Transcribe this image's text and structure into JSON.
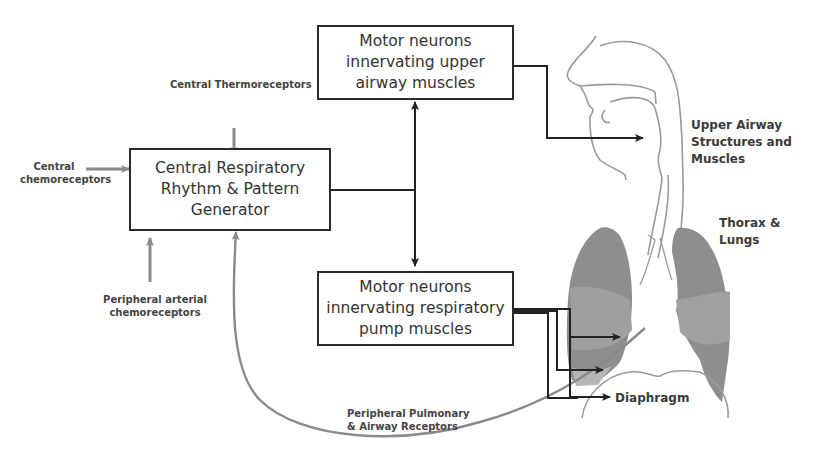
{
  "diagram": {
    "boxes": {
      "cprg": [
        "Central Respiratory",
        "Rhythm & Pattern",
        "Generator"
      ],
      "upper": [
        "Motor neurons",
        "innervating upper",
        "airway muscles"
      ],
      "pump": [
        "Motor neurons",
        "innervating respiratory",
        "pump muscles"
      ]
    },
    "inputs": {
      "thermo": "Central Thermoreceptors",
      "chemo_central": [
        "Central",
        "chemoreceptors"
      ],
      "chemo_peripheral": [
        "Peripheral arterial",
        "chemoreceptors"
      ],
      "pulmonary": [
        "Peripheral Pulmonary",
        "& Airway Receptors"
      ]
    },
    "targets": {
      "upper_airway": [
        "Upper Airway",
        "Structures and Muscles"
      ],
      "thorax": [
        "Thorax &",
        "Lungs"
      ],
      "diaphragm": "Diaphragm"
    },
    "colors": {
      "box_border": "#2b2b2b",
      "efferent_arrow": "#222222",
      "afferent_arrow": "#8a8a8a",
      "lung_dark": "#8c8c8c",
      "lung_light": "#a9a9a9",
      "airway_outline": "#9a9a9a"
    }
  }
}
